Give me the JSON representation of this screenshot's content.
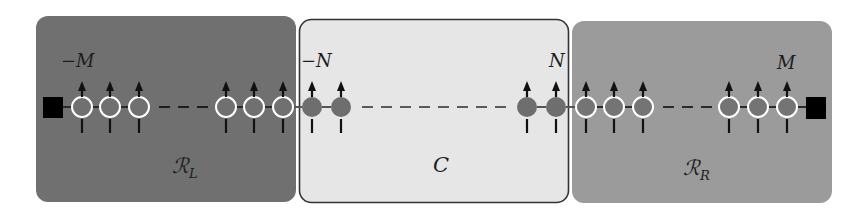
{
  "regions": {
    "left": {
      "label_main": "ℛ",
      "label_sub": "L",
      "fill": "#707070"
    },
    "center": {
      "label": "C",
      "fill": "#e6e6e6",
      "border": "#333333"
    },
    "right": {
      "label_main": "ℛ",
      "label_sub": "R",
      "fill": "#9b9b9b"
    }
  },
  "site_labels": {
    "left_end": "−M",
    "center_left": "−N",
    "center_right": "N",
    "right_end": "M"
  },
  "chain": {
    "left_region_sites_shown": 6,
    "center_region_sites_shown": 4,
    "right_region_sites_shown": 6,
    "spin_direction": "up",
    "end_terminals": "black square at both ends",
    "colors": {
      "terminal": "#000000",
      "site_fill": "#707070",
      "reservoir_site_outline": "#ffffff"
    }
  }
}
